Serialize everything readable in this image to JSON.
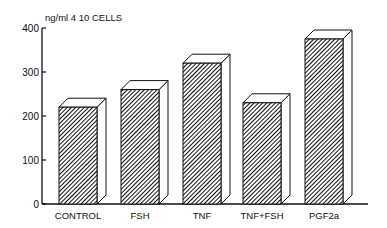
{
  "chart_data": {
    "type": "bar",
    "title": "",
    "ylabel": "ng/ml 4 10 CELLS",
    "xlabel": "",
    "categories": [
      "CONTROL",
      "FSH",
      "TNF",
      "TNF+FSH",
      "PGF2a"
    ],
    "values": [
      220,
      260,
      320,
      230,
      375
    ],
    "ylim": [
      0,
      400
    ],
    "yticks": [
      0,
      100,
      200,
      300,
      400
    ],
    "grid": false,
    "legend": null,
    "style": "3d hatched bars"
  },
  "colors": {
    "ink": "#111111",
    "background": "#ffffff",
    "bar_side": "#ffffff"
  }
}
